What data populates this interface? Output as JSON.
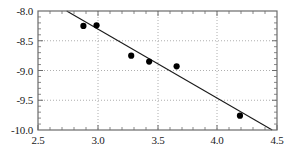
{
  "chart_data": {
    "type": "scatter",
    "title": "",
    "subtitle": "",
    "xlabel": "",
    "ylabel": "",
    "xlim": [
      2.5,
      4.5
    ],
    "ylim": [
      -10.0,
      -8.0
    ],
    "grid": true,
    "grid_style": "dotted",
    "legend": "none",
    "xticks": [
      2.5,
      3.0,
      3.5,
      4.0,
      4.5
    ],
    "xtick_labels": [
      "2.5",
      "3.0",
      "3.5",
      "4.0",
      "4.5"
    ],
    "yticks": [
      -8.0,
      -8.5,
      -9.0,
      -9.5,
      -10.0
    ],
    "ytick_labels": [
      "-8.0",
      "-8.5",
      "-9.0",
      "-9.5",
      "-10.0"
    ],
    "x_minor_ticks": [
      2.6,
      2.7,
      2.8,
      2.9,
      3.1,
      3.2,
      3.3,
      3.4,
      3.6,
      3.7,
      3.8,
      3.9,
      4.1,
      4.2,
      4.3,
      4.4
    ],
    "y_minor_ticks": [
      -8.1,
      -8.2,
      -8.3,
      -8.4,
      -8.6,
      -8.7,
      -8.8,
      -8.9,
      -9.1,
      -9.2,
      -9.3,
      -9.4,
      -9.6,
      -9.7,
      -9.8,
      -9.9
    ],
    "series": [
      {
        "name": "data points",
        "type": "scatter",
        "marker": "filled-circle",
        "marker_size": 5,
        "color": "#000000",
        "x": [
          2.88,
          2.99,
          3.28,
          3.43,
          3.66,
          4.19
        ],
        "y": [
          -8.25,
          -8.24,
          -8.75,
          -8.85,
          -8.93,
          -9.76
        ]
      },
      {
        "name": "linear fit",
        "type": "line",
        "color": "#1a1a1a",
        "line_width": 1,
        "x": [
          2.74,
          4.46
        ],
        "y": [
          -8.0,
          -10.0
        ],
        "slope": -1.163,
        "intercept": -4.814
      }
    ],
    "frame": {
      "color": "#6b6b6b",
      "line_width": 1,
      "visible_sides": [
        "top",
        "right",
        "bottom",
        "left"
      ]
    },
    "grid_color": "#9a9a9a"
  }
}
